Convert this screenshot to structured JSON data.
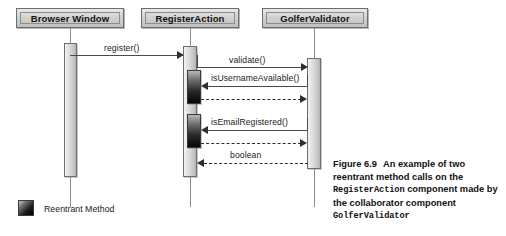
{
  "diagram": {
    "type": "uml-sequence-diagram",
    "participants": [
      {
        "id": "browser",
        "name": "Browser Window"
      },
      {
        "id": "registeraction",
        "name": "RegisterAction"
      },
      {
        "id": "golfervalidator",
        "name": "GolferValidator"
      }
    ],
    "messages": [
      {
        "index": 1,
        "label": "register()",
        "from": "browser",
        "to": "registeraction",
        "style": "solid",
        "direction": "right"
      },
      {
        "index": 2,
        "label": "validate()",
        "from": "registeraction",
        "to": "golfervalidator",
        "style": "solid",
        "direction": "right"
      },
      {
        "index": 3,
        "label": "isUsernameAvailable()",
        "from": "golfervalidator",
        "to": "registeraction",
        "style": "solid",
        "direction": "left",
        "reentrant": true
      },
      {
        "index": 4,
        "label": "",
        "from": "registeraction",
        "to": "golfervalidator",
        "style": "dashed",
        "direction": "right"
      },
      {
        "index": 5,
        "label": "isEmailRegistered()",
        "from": "golfervalidator",
        "to": "registeraction",
        "style": "solid",
        "direction": "left",
        "reentrant": true
      },
      {
        "index": 6,
        "label": "",
        "from": "registeraction",
        "to": "golfervalidator",
        "style": "dashed",
        "direction": "right"
      },
      {
        "index": 7,
        "label": "boolean",
        "from": "golfervalidator",
        "to": "registeraction",
        "style": "dashed",
        "direction": "left"
      }
    ]
  },
  "legend": {
    "label": "Reentrant Method",
    "swatch_color": "#101010"
  },
  "caption": {
    "figure_number": "Figure 6.9",
    "text_part1": "An example of two reentrant method calls on the",
    "code1": "RegisterAction",
    "text_part2": "component made by the collaborator component",
    "code2": "GolferValidator"
  },
  "colors": {
    "box_fill": "#d2d2d2",
    "box_border": "#6d6d6d",
    "activation_fill": "#e2e2e2",
    "reentrant_fill": "#101010",
    "line": "#4a4a4a",
    "background": "#ffffff"
  }
}
